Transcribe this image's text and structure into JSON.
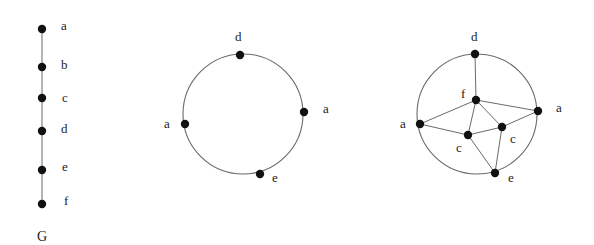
{
  "figure": {
    "graph_path": {
      "caption": "G",
      "nodes": [
        {
          "id": "a",
          "label": "a",
          "x": 42,
          "y": 29
        },
        {
          "id": "b",
          "label": "b",
          "x": 42,
          "y": 67
        },
        {
          "id": "c",
          "label": "c",
          "x": 42,
          "y": 98
        },
        {
          "id": "d",
          "label": "d",
          "x": 42,
          "y": 131
        },
        {
          "id": "e",
          "label": "e",
          "x": 42,
          "y": 170
        },
        {
          "id": "f",
          "label": "f",
          "x": 42,
          "y": 204
        }
      ],
      "edges": [
        [
          "a",
          "b"
        ],
        [
          "b",
          "c"
        ],
        [
          "c",
          "d"
        ],
        [
          "d",
          "e"
        ],
        [
          "e",
          "f"
        ]
      ]
    },
    "graph_circle": {
      "center": {
        "x": 243,
        "y": 114
      },
      "radius": 60,
      "nodes": [
        {
          "id": "d",
          "label": "d",
          "x": 240,
          "y": 55
        },
        {
          "id": "a1",
          "label": "a",
          "x": 304,
          "y": 112
        },
        {
          "id": "a2",
          "label": "a",
          "x": 185,
          "y": 124
        },
        {
          "id": "e",
          "label": "e",
          "x": 260,
          "y": 174
        }
      ]
    },
    "graph_embedded": {
      "center": {
        "x": 477,
        "y": 114
      },
      "radius": 60,
      "nodes": [
        {
          "id": "d",
          "label": "d",
          "x": 475,
          "y": 54
        },
        {
          "id": "f",
          "label": "f",
          "x": 476,
          "y": 100
        },
        {
          "id": "a1",
          "label": "a",
          "x": 538,
          "y": 111
        },
        {
          "id": "a2",
          "label": "a",
          "x": 420,
          "y": 124
        },
        {
          "id": "c1",
          "label": "c",
          "x": 468,
          "y": 135
        },
        {
          "id": "c2",
          "label": "c",
          "x": 502,
          "y": 127
        },
        {
          "id": "e",
          "label": "e",
          "x": 495,
          "y": 173
        }
      ],
      "edges": [
        [
          "d",
          "f"
        ],
        [
          "f",
          "a1"
        ],
        [
          "f",
          "a2"
        ],
        [
          "f",
          "c1"
        ],
        [
          "f",
          "c2"
        ],
        [
          "a2",
          "c1"
        ],
        [
          "c1",
          "c2"
        ],
        [
          "c2",
          "a1"
        ],
        [
          "c1",
          "e"
        ],
        [
          "c2",
          "e"
        ]
      ]
    }
  },
  "labels": {
    "path": {
      "a": "a",
      "b": "b",
      "c": "c",
      "d": "d",
      "e": "e",
      "f": "f",
      "caption": "G"
    },
    "circle": {
      "d": "d",
      "a1": "a",
      "a2": "a",
      "e": "e"
    },
    "embedded": {
      "d": "d",
      "f": "f",
      "a1": "a",
      "a2": "a",
      "c1": "c",
      "c2": "c",
      "e": "e"
    }
  }
}
